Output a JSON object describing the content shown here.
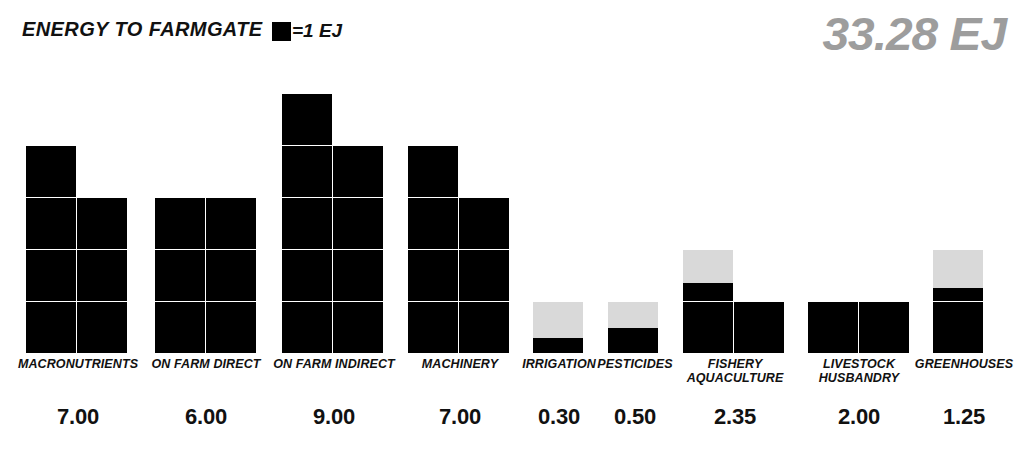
{
  "header": {
    "title": "ENERGY TO FARMGATE",
    "legend_text": "=1 EJ",
    "legend_icon": "black-square-icon",
    "total": "33.28 EJ",
    "total_color": "#9d9d9d"
  },
  "chart_data": {
    "type": "bar",
    "title": "ENERGY TO FARMGATE",
    "subtitle": "",
    "xlabel": "",
    "ylabel": "",
    "unit": "EJ",
    "unit_note": "=1 EJ",
    "total": 33.28,
    "total_label": "33.28 EJ",
    "style": "waffle-unit-squares (each square = 1 EJ, bars 2 columns wide, filled black, remainder light gray)",
    "columns_per_bar": [
      2,
      2,
      2,
      2,
      1,
      1,
      2,
      2,
      1
    ],
    "grid": false,
    "legend_position": "top-center",
    "filled_color": "#000000",
    "empty_color": "#d9d9d9",
    "categories": [
      "MACRONUTRIENTS",
      "ON FARM DIRECT",
      "ON FARM INDIRECT",
      "MACHINERY",
      "IRRIGATION",
      "PESTICIDES",
      "FISHERY AQUACULTURE",
      "LIVESTOCK HUSBANDRY",
      "GREENHOUSES"
    ],
    "values": [
      7.0,
      6.0,
      9.0,
      7.0,
      0.3,
      0.5,
      2.35,
      2.0,
      1.25
    ],
    "value_labels": [
      "7.00",
      "6.00",
      "9.00",
      "7.00",
      "0.30",
      "0.50",
      "2.35",
      "2.00",
      "1.25"
    ],
    "ylim": [
      0,
      10
    ]
  },
  "bars": [
    {
      "label": "MACRONUTRIENTS",
      "label_lines": "MACRONUTRIENTS",
      "value": "7.00",
      "value_num": 7.0,
      "cols": 2,
      "x": 26,
      "label_x": 8,
      "label_w": 140,
      "value_x": 16,
      "value_w": 124
    },
    {
      "label": "ON FARM DIRECT",
      "label_lines": "ON FARM DIRECT",
      "value": "6.00",
      "value_num": 6.0,
      "cols": 2,
      "x": 155,
      "label_x": 143,
      "label_w": 126,
      "value_x": 143,
      "value_w": 126
    },
    {
      "label": "ON FARM INDIRECT",
      "label_lines": "ON FARM INDIRECT",
      "value": "9.00",
      "value_num": 9.0,
      "cols": 2,
      "x": 282,
      "label_x": 264,
      "label_w": 140,
      "value_x": 270,
      "value_w": 128
    },
    {
      "label": "MACHINERY",
      "label_lines": "MACHINERY",
      "value": "7.00",
      "value_num": 7.0,
      "cols": 2,
      "x": 408,
      "label_x": 396,
      "label_w": 128,
      "value_x": 396,
      "value_w": 128
    },
    {
      "label": "IRRIGATION",
      "label_lines": "IRRIGATION",
      "value": "0.30",
      "value_num": 0.3,
      "cols": 1,
      "x": 533,
      "label_x": 512,
      "label_w": 94,
      "value_x": 512,
      "value_w": 94
    },
    {
      "label": "PESTICIDES",
      "label_lines": "PESTICIDES",
      "value": "0.50",
      "value_num": 0.5,
      "cols": 1,
      "x": 608,
      "label_x": 588,
      "label_w": 94,
      "value_x": 588,
      "value_w": 94
    },
    {
      "label": "FISHERY AQUACULTURE",
      "label_lines": "FISHERY\nAQUACULTURE",
      "value": "2.35",
      "value_num": 2.35,
      "cols": 2,
      "x": 683,
      "label_x": 676,
      "label_w": 118,
      "value_x": 676,
      "value_w": 118
    },
    {
      "label": "LIVESTOCK HUSBANDRY",
      "label_lines": "LIVESTOCK\nHUSBANDRY",
      "value": "2.00",
      "value_num": 2.0,
      "cols": 2,
      "x": 808,
      "label_x": 802,
      "label_w": 114,
      "value_x": 802,
      "value_w": 114
    },
    {
      "label": "GREENHOUSES",
      "label_lines": "GREENHOUSES",
      "value": "1.25",
      "value_num": 1.25,
      "cols": 1,
      "x": 933,
      "label_x": 912,
      "label_w": 104,
      "value_x": 912,
      "value_w": 104
    }
  ],
  "geometry": {
    "baseline_y": 353,
    "cell_w": 51,
    "cell_h": 52,
    "label_y": 358,
    "value_y": 404
  }
}
